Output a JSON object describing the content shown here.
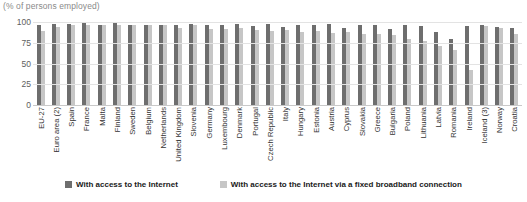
{
  "subtitle": "(% of persons employed)",
  "legend": {
    "items": [
      {
        "label": "With access to the Internet",
        "color": "#6e6e6e",
        "swatch": "square-marker-icon"
      },
      {
        "label": "With access to the Internet via a fixed broadband connection",
        "color": "#c6c6c6",
        "swatch": "square-marker-icon"
      }
    ]
  },
  "chart_data": {
    "type": "bar",
    "title": "",
    "subtitle": "(% of persons employed)",
    "xlabel": "",
    "ylabel": "",
    "ylim": [
      0,
      100
    ],
    "yticks": [
      0,
      25,
      50,
      75,
      100
    ],
    "grid": true,
    "legend_position": "bottom",
    "orientation": "vertical",
    "categories": [
      "EU-27",
      "Euro area (2)",
      "Spain",
      "France",
      "Malta",
      "Finland",
      "Sweden",
      "Belgium",
      "Netherlands",
      "United Kingdom",
      "Slovenia",
      "Germany",
      "Luxembourg",
      "Denmark",
      "Portugal",
      "Czech Republic",
      "Italy",
      "Hungary",
      "Estonia",
      "Austria",
      "Cyprus",
      "Slovakia",
      "Greece",
      "Bulgaria",
      "Poland",
      "Lithuania",
      "Latvia",
      "Romania",
      "Ireland",
      "Iceland (3)",
      "Norway",
      "Croatia"
    ],
    "series": [
      {
        "name": "With access to the Internet",
        "color": "#6e6e6e",
        "values": [
          97,
          98,
          98,
          99,
          97,
          100,
          97,
          97,
          97,
          96,
          98,
          96,
          96,
          98,
          95,
          98,
          94,
          96,
          96,
          98,
          93,
          96,
          96,
          92,
          96,
          95,
          88,
          79,
          95,
          96,
          94,
          93
        ]
      },
      {
        "name": "With access to the Internet via a fixed broadband connection",
        "color": "#c6c6c6",
        "values": [
          89,
          94,
          97,
          96,
          97,
          97,
          96,
          96,
          96,
          93,
          97,
          92,
          91,
          93,
          90,
          89,
          90,
          88,
          89,
          87,
          88,
          85,
          86,
          84,
          80,
          77,
          71,
          66,
          42,
          95,
          93,
          86
        ]
      }
    ]
  }
}
